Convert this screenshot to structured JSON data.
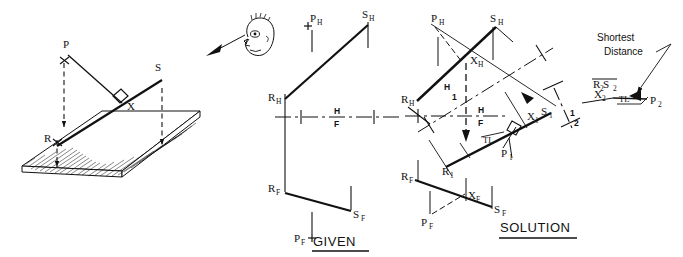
{
  "figure": {
    "ink_color": "#111111",
    "paper_color": "#ffffff",
    "panels": [
      "pictorial",
      "given",
      "solution"
    ]
  },
  "pictorial": {
    "name": "pictorial-plane-and-line",
    "labels": {
      "point_p": "P",
      "point_s": "S",
      "point_r": "R",
      "point_x": "X"
    },
    "observer_icon": "eye-face-icon",
    "observer_arrow": "viewing-direction-arrow"
  },
  "given": {
    "caption": "GIVEN",
    "fold_line": {
      "top": "H",
      "bottom": "F"
    },
    "labels": {
      "p_h": "P",
      "p_h_sub": "H",
      "s_h": "S",
      "s_h_sub": "H",
      "r_h": "R",
      "r_h_sub": "H",
      "r_f": "R",
      "r_f_sub": "F",
      "s_f": "S",
      "s_f_sub": "F",
      "p_f": "P",
      "p_f_sub": "F"
    },
    "marks": {
      "p_h_plus": "+",
      "p_f_plus": "+"
    }
  },
  "solution": {
    "caption": "SOLUTION",
    "fold_lines": [
      {
        "name": "H-F",
        "top": "H",
        "bottom": "F"
      },
      {
        "name": "H-1",
        "top": "H",
        "bottom": "1"
      },
      {
        "name": "1-2",
        "top": "1",
        "bottom": "2"
      }
    ],
    "labels": {
      "p_h": "P",
      "p_h_sub": "H",
      "s_h": "S",
      "s_h_sub": "H",
      "x_h": "X",
      "x_h_sub": "H",
      "r_h": "R",
      "r_h_sub": "H",
      "r_1": "R",
      "r_1_sub": "1",
      "x_1": "X",
      "x_1_sub": "1",
      "p_1": "P",
      "p_1_sub": "1",
      "s_1": "S",
      "s_1_sub": "1",
      "r_f": "R",
      "r_f_sub": "F",
      "x_f": "X",
      "x_f_sub": "F",
      "s_f": "S",
      "s_f_sub": "F",
      "p_f": "P",
      "p_f_sub": "F",
      "r2s2": "R S",
      "r2s2_sub_a": "2",
      "r2s2_sub_b": "2",
      "x_2": "X",
      "x_2_sub": "2",
      "p_2": "P",
      "p_2_sub": "2",
      "tl_view1": "TL",
      "tl_view2": "TL"
    },
    "annotation": {
      "shortest_line1": "Shortest",
      "shortest_line2": "Distance",
      "leader": "leader-arrow"
    }
  }
}
